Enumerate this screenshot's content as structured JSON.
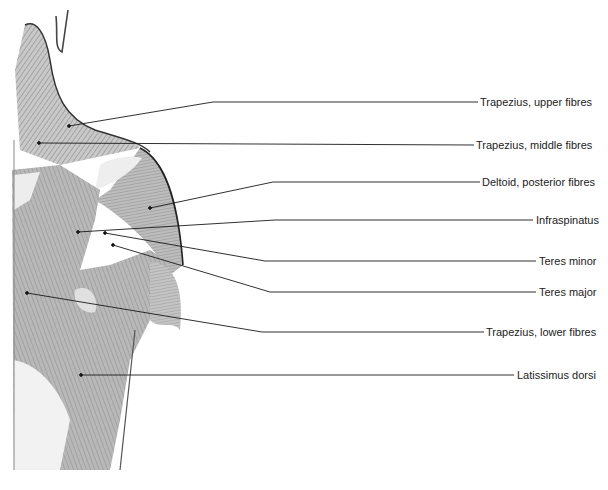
{
  "diagram": {
    "labels": [
      {
        "id": "trapezius-upper",
        "text": "Trapezius, upper fibres",
        "x": 480,
        "y": 96,
        "dot": [
          69,
          126
        ],
        "elbow": [
          213,
          102
        ],
        "end": [
          478,
          102
        ]
      },
      {
        "id": "trapezius-middle",
        "text": "Trapezius, middle fibres",
        "x": 476,
        "y": 139,
        "dot": [
          39,
          143
        ],
        "elbow": null,
        "end": [
          474,
          145
        ]
      },
      {
        "id": "deltoid-posterior",
        "text": "Deltoid, posterior fibres",
        "x": 482,
        "y": 176,
        "dot": [
          150,
          208
        ],
        "elbow": [
          273,
          182
        ],
        "end": [
          480,
          182
        ]
      },
      {
        "id": "infraspinatus",
        "text": "Infraspinatus",
        "x": 536,
        "y": 214,
        "dot": [
          78,
          232
        ],
        "elbow": [
          275,
          220
        ],
        "end": [
          533,
          220
        ]
      },
      {
        "id": "teres-minor",
        "text": "Teres minor",
        "x": 539,
        "y": 255,
        "dot": [
          105,
          233
        ],
        "elbow": [
          265,
          261
        ],
        "end": [
          536,
          261
        ]
      },
      {
        "id": "teres-major",
        "text": "Teres major",
        "x": 539,
        "y": 286,
        "dot": [
          113,
          245
        ],
        "elbow": [
          270,
          292
        ],
        "end": [
          536,
          292
        ]
      },
      {
        "id": "trapezius-lower",
        "text": "Trapezius, lower fibres",
        "x": 486,
        "y": 326,
        "dot": [
          27,
          293
        ],
        "elbow": [
          262,
          332
        ],
        "end": [
          484,
          332
        ]
      },
      {
        "id": "latissimus-dorsi",
        "text": "Latissimus dorsi",
        "x": 517,
        "y": 369,
        "dot": [
          81,
          375
        ],
        "elbow": null,
        "end": [
          514,
          375
        ]
      }
    ]
  }
}
